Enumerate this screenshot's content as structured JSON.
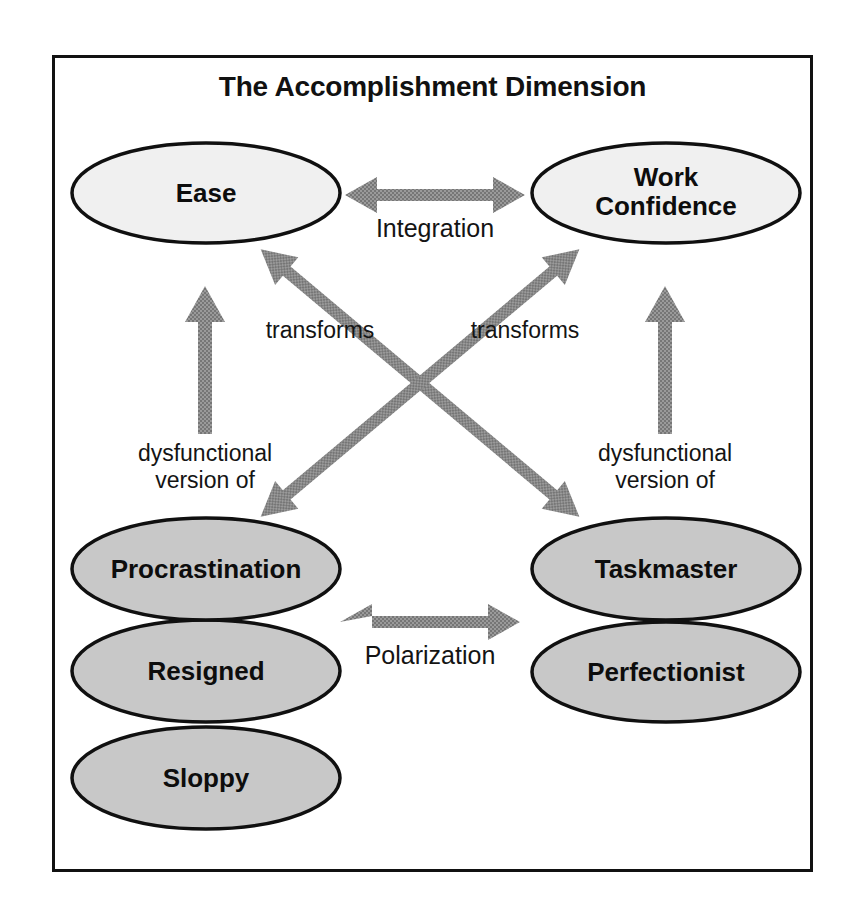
{
  "diagram": {
    "title": "The Accomplishment Dimension",
    "type": "concept-map",
    "colors": {
      "border": "#111111",
      "node_top_fill": "#f0f0f0",
      "node_bottom_fill": "#c8c8c8",
      "node_stroke": "#101010",
      "arrow": "#8c8c8c",
      "text": "#0d0d0d"
    },
    "nodes": [
      {
        "id": "ease",
        "label": "Ease",
        "group": "functional",
        "side": "left",
        "fill": "#f0f0f0"
      },
      {
        "id": "work-confidence",
        "label": "Work\nConfidence",
        "group": "functional",
        "side": "right",
        "fill": "#f0f0f0"
      },
      {
        "id": "procrastination",
        "label": "Procrastination",
        "group": "dysfunctional",
        "side": "left",
        "fill": "#c8c8c8"
      },
      {
        "id": "resigned",
        "label": "Resigned",
        "group": "dysfunctional",
        "side": "left",
        "fill": "#c8c8c8"
      },
      {
        "id": "sloppy",
        "label": "Sloppy",
        "group": "dysfunctional",
        "side": "left",
        "fill": "#c8c8c8"
      },
      {
        "id": "taskmaster",
        "label": "Taskmaster",
        "group": "dysfunctional",
        "side": "right",
        "fill": "#c8c8c8"
      },
      {
        "id": "perfectionist",
        "label": "Perfectionist",
        "group": "dysfunctional",
        "side": "right",
        "fill": "#c8c8c8"
      }
    ],
    "node_labels": {
      "ease": "Ease",
      "work_confidence_line1": "Work",
      "work_confidence_line2": "Confidence",
      "procrastination": "Procrastination",
      "resigned": "Resigned",
      "sloppy": "Sloppy",
      "taskmaster": "Taskmaster",
      "perfectionist": "Perfectionist"
    },
    "edges": [
      {
        "id": "integration",
        "label": "Integration",
        "from": "ease",
        "to": "work-confidence",
        "style": "double-headed-horizontal"
      },
      {
        "id": "polarization",
        "label": "Polarization",
        "from": "procrastination",
        "to": "taskmaster",
        "style": "double-headed-horizontal"
      },
      {
        "id": "transforms-left",
        "label": "transforms",
        "from": "ease",
        "to": "taskmaster",
        "style": "double-headed-diagonal"
      },
      {
        "id": "transforms-right",
        "label": "transforms",
        "from": "work-confidence",
        "to": "procrastination",
        "style": "double-headed-diagonal"
      },
      {
        "id": "dysfunctional-left",
        "label": "dysfunctional\nversion of",
        "from": "procrastination",
        "to": "ease",
        "style": "single-headed-vertical-up"
      },
      {
        "id": "dysfunctional-right",
        "label": "dysfunctional\nversion of",
        "from": "taskmaster",
        "to": "work-confidence",
        "style": "single-headed-vertical-up"
      }
    ],
    "edge_labels": {
      "integration": "Integration",
      "polarization": "Polarization",
      "transforms_left": "transforms",
      "transforms_right": "transforms",
      "dysfunctional_left_line1": "dysfunctional",
      "dysfunctional_left_line2": "version of",
      "dysfunctional_right_line1": "dysfunctional",
      "dysfunctional_right_line2": "version of"
    }
  }
}
